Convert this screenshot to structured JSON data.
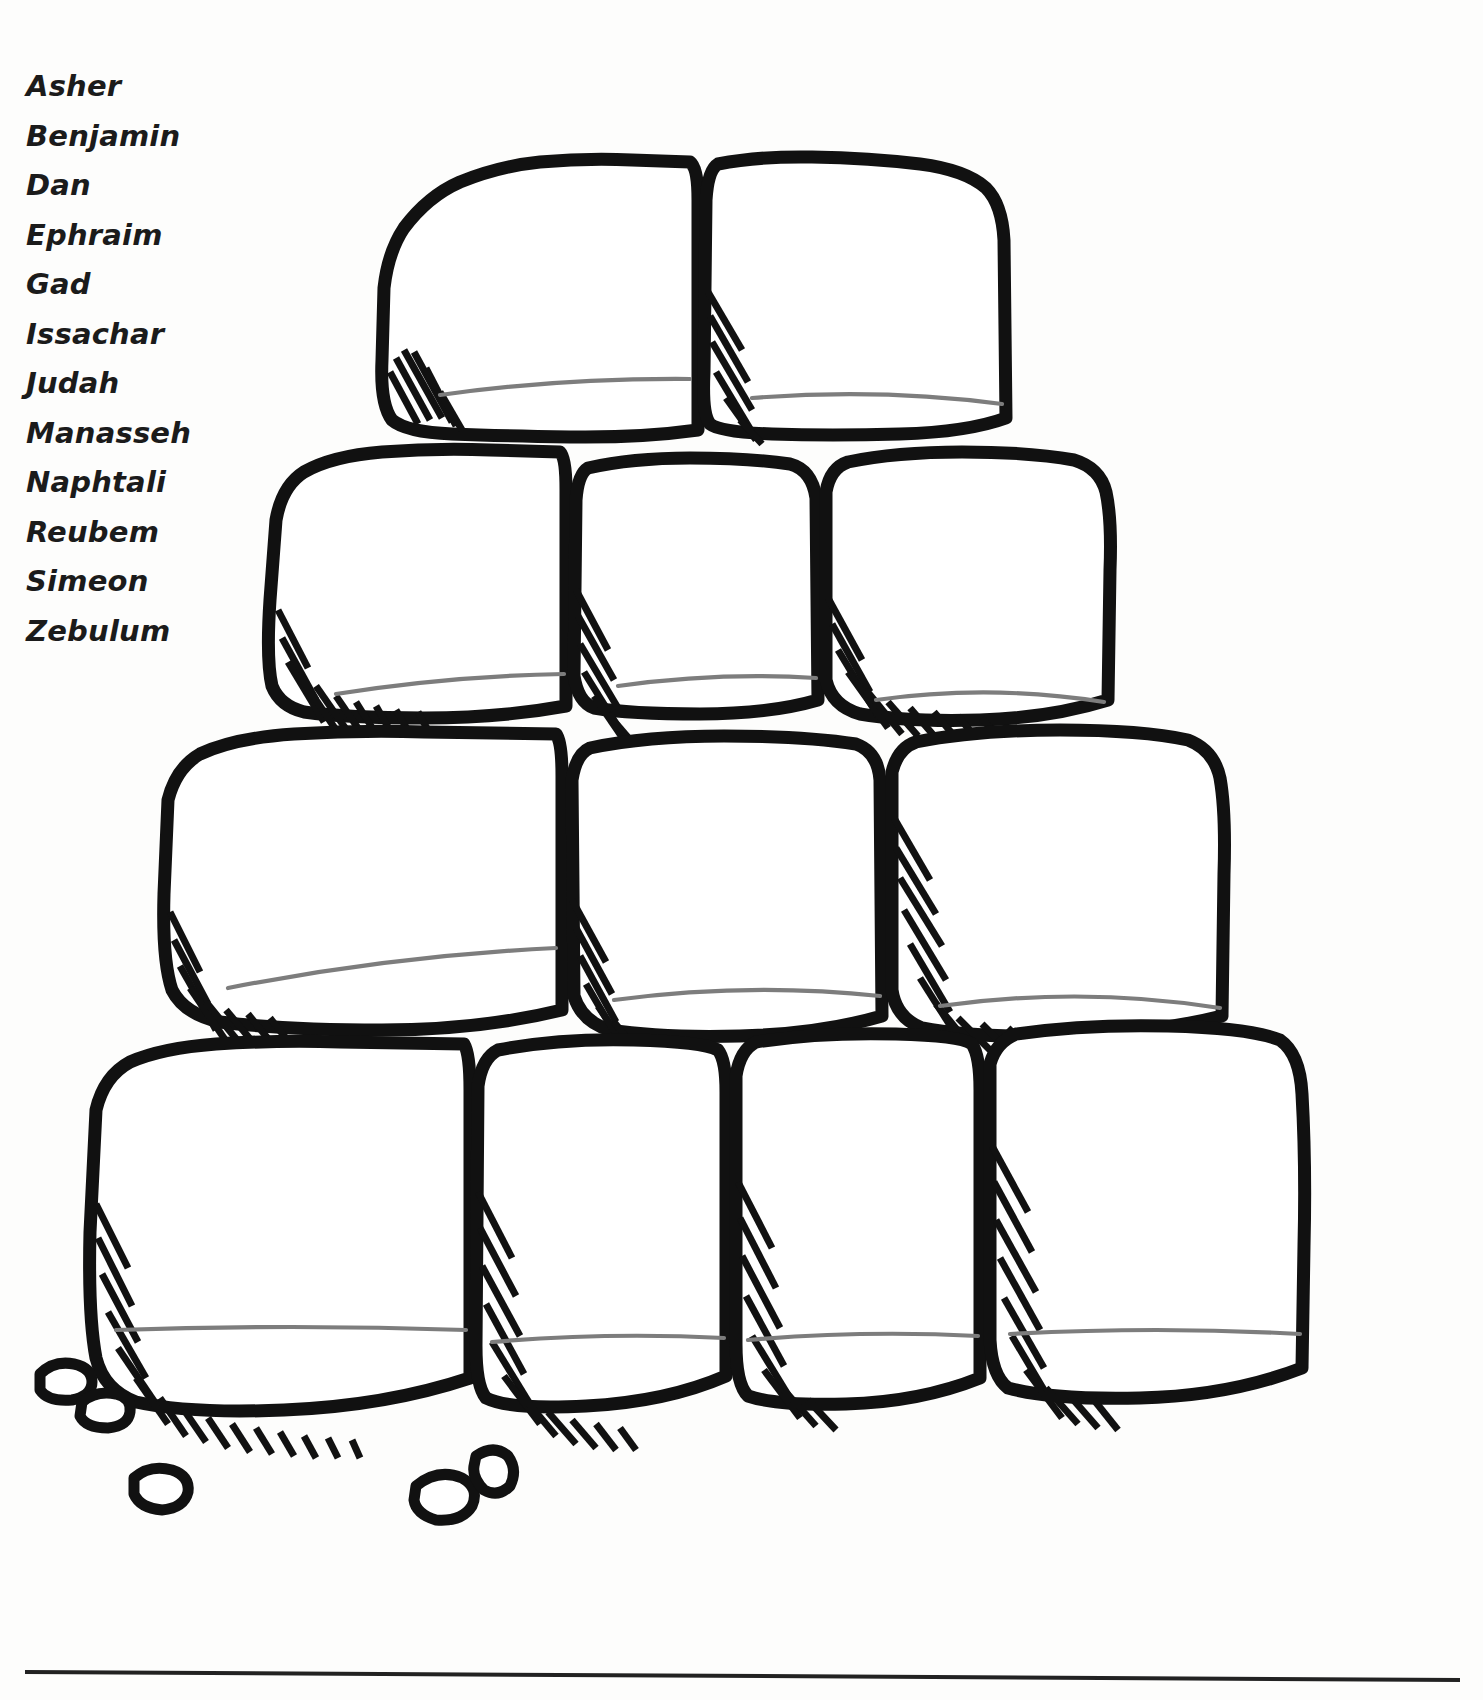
{
  "page": {
    "background_color": "#fdfdfc",
    "ink_color": "#111111",
    "rule_color": "#7d7d7d"
  },
  "tribe_list": {
    "name": "twelve-tribes-name-list",
    "items": [
      {
        "label": "Asher"
      },
      {
        "label": "Benjamin"
      },
      {
        "label": "Dan"
      },
      {
        "label": "Ephraim"
      },
      {
        "label": "Gad"
      },
      {
        "label": "Issachar"
      },
      {
        "label": "Judah"
      },
      {
        "label": "Manasseh"
      },
      {
        "label": "Naphtali"
      },
      {
        "label": "Reubem"
      },
      {
        "label": "Simeon"
      },
      {
        "label": "Zebulum"
      }
    ]
  },
  "illustration": {
    "title": "stone-wall-pyramid",
    "description": "Hand drawn pyramid of twelve blank stones with ruled writing lines",
    "rows": [
      {
        "row": 1,
        "stone_count": 2,
        "stones": [
          {
            "label": ""
          },
          {
            "label": ""
          }
        ]
      },
      {
        "row": 2,
        "stone_count": 3,
        "stones": [
          {
            "label": ""
          },
          {
            "label": ""
          },
          {
            "label": ""
          }
        ]
      },
      {
        "row": 3,
        "stone_count": 3,
        "stones": [
          {
            "label": ""
          },
          {
            "label": ""
          },
          {
            "label": ""
          }
        ]
      },
      {
        "row": 4,
        "stone_count": 4,
        "stones": [
          {
            "label": ""
          },
          {
            "label": ""
          },
          {
            "label": ""
          },
          {
            "label": ""
          }
        ]
      }
    ],
    "total_stones": 12,
    "pebble_count": 5,
    "stone_fill": "#ffffff",
    "outline_color": "#111111",
    "writing_line_color": "#7d7d7d"
  },
  "footer_rule": {
    "name": "footer-divider",
    "color": "#222222"
  }
}
